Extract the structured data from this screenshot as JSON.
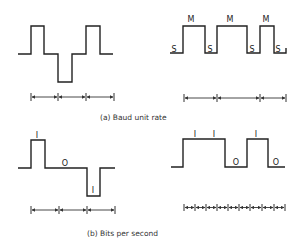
{
  "figure": {
    "panels": [
      {
        "id": "a",
        "caption": "(a) Baud unit rate",
        "left_waveform": {
          "description": "three-level signal: high, baseline, low, baseline, high",
          "segments": [
            "high",
            "low",
            "high"
          ]
        },
        "right_waveform": {
          "description": "two-level mark/space signal",
          "mark_labels": [
            "M",
            "M",
            "M"
          ],
          "space_labels": [
            "S",
            "S",
            "S",
            "S"
          ]
        },
        "left_ruler_intervals": 3,
        "right_ruler_intervals": 3
      },
      {
        "id": "b",
        "caption": "(b) Bits per second",
        "left_waveform": {
          "description": "three-level signal with bit labels",
          "bit_labels": [
            "I",
            "O",
            "I"
          ]
        },
        "right_waveform": {
          "description": "two-level binary signal with bit labels",
          "bit_labels": [
            "I",
            "I",
            "O",
            "I",
            "O"
          ]
        },
        "left_ruler_intervals": 3,
        "right_ruler_intervals": 9
      }
    ]
  }
}
